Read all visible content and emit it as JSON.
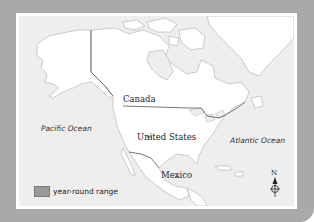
{
  "map": {
    "type": "range map",
    "region": "North America",
    "colors": {
      "frame": "#a9a9a9",
      "border": "#ffffff",
      "ocean": "#eeeeee",
      "land": "#ffffff",
      "coastline": "#b8b8b8",
      "national_border": "#555555",
      "range": "#999999"
    },
    "labels": {
      "canada": "Canada",
      "united_states": "United States",
      "mexico": "Mexico",
      "pacific": "Pacific Ocean",
      "atlantic": "Atlantic Ocean"
    },
    "legend": {
      "items": [
        {
          "label": "year-round range",
          "color": "#999999"
        }
      ]
    },
    "compass": {
      "north_label": "N"
    }
  }
}
